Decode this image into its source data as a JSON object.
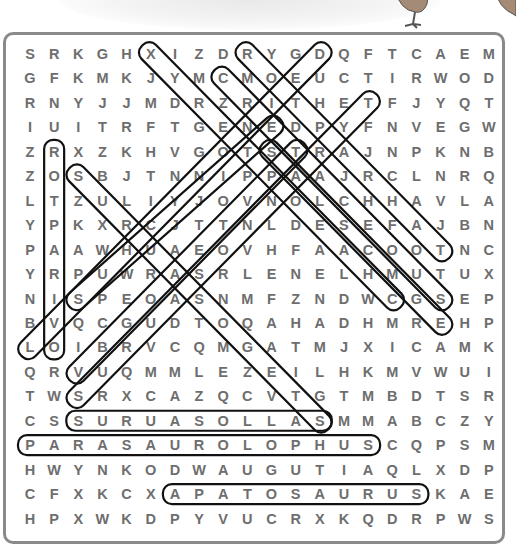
{
  "puzzle": {
    "title_fragment": "Dinosaur",
    "rows": [
      "SRKGHXIZDRYGDQFTCAEM",
      "GFKMKJYMCMOEUCTIRWOD",
      "RNYJJMDRZRITHETFJYQT",
      "IUITRFTGENEDPYFNVEGW",
      "ZRXZKHVGOTSTRAJNPKNB",
      "ZOSBJTNNIPPAAJRCLNRQ",
      "LTZULIYJOVNOLCHHAVLA",
      "YPKXRCJTTNLDESEFAJBN",
      "PAAWHUAEOVHFAACOOTNC",
      "YRPUWRASRLENELHMUTUX",
      "NISPEOASNMFZNDWCGSEP",
      "BVQCGUDTOQAHADHMREHP",
      "LOIBRVCQMGATMJXICAMK",
      "QRVUQMMLEZEILHKMVWUI",
      "TWSRXCAZQCVTGTMBDTSR",
      "CSSURUASOLLASMMABCZY",
      "PARASAUROLOPHUSCQPSM",
      "HWYNKODWAUGUTIAQLXDP",
      "CFXKCXAPATOSAURUSKAE",
      "HPXWKDPYVUCRXKQDRPWS"
    ],
    "found_words": [
      {
        "word": "SURUASOLLAS",
        "row": 16,
        "col_start": 3,
        "col_end": 13,
        "direction": "horizontal"
      },
      {
        "word": "PARASAUROLOPHUS",
        "row": 17,
        "col_start": 1,
        "col_end": 15,
        "direction": "horizontal"
      },
      {
        "word": "APATOSAURUS",
        "row": 19,
        "col_start": 7,
        "col_end": 17,
        "direction": "horizontal"
      },
      {
        "word": "vertical-col2",
        "col": 2,
        "row_start": 5,
        "row_end": 13,
        "direction": "vertical"
      },
      {
        "word": "diag-1",
        "direction": "diagonal"
      },
      {
        "word": "diag-2",
        "direction": "diagonal"
      },
      {
        "word": "diag-3",
        "direction": "diagonal"
      },
      {
        "word": "diag-4",
        "direction": "diagonal"
      },
      {
        "word": "diag-5",
        "direction": "diagonal"
      },
      {
        "word": "diag-6",
        "direction": "diagonal"
      },
      {
        "word": "diag-7",
        "direction": "diagonal"
      },
      {
        "word": "diag-8",
        "direction": "diagonal"
      },
      {
        "word": "diag-9",
        "direction": "diagonal"
      }
    ],
    "colors": {
      "letter": "#6e6e6e",
      "border": "#8a8a8a",
      "oval": "#111111"
    }
  }
}
